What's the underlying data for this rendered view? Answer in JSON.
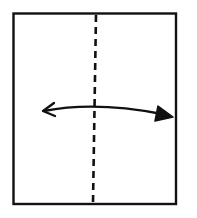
{
  "diagram": {
    "type": "origami-fold-instruction",
    "paper": {
      "x": 13,
      "y": 13,
      "width": 163,
      "height": 191,
      "stroke": "#111111"
    },
    "fold_line": {
      "style": "dashed",
      "orientation": "vertical",
      "x_top": 96,
      "x_bottom": 93,
      "stroke": "#111111"
    },
    "arrow": {
      "type": "fold-and-unfold",
      "from": [
        42,
        111
      ],
      "to": [
        173,
        116
      ],
      "stroke": "#111111",
      "left_head": "open",
      "right_head": "filled"
    },
    "background": "#ffffff"
  }
}
